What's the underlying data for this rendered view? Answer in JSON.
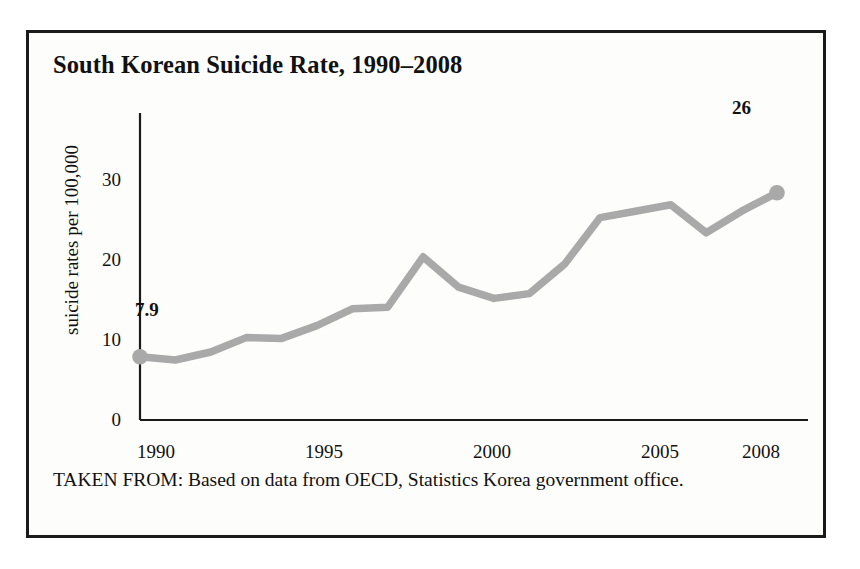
{
  "figure": {
    "title": "South Korean Suicide Rate, 1990–2008",
    "caption": "TAKEN FROM: Based on data from OECD, Statistics Korea government office.",
    "line_color": "#a9a9a9",
    "axis_color": "#1a1a1a",
    "border_color": "#1a1a1a",
    "text_color": "#111111"
  },
  "chart_data": {
    "type": "line",
    "title": "South Korean Suicide Rate, 1990–2008",
    "xlabel": "",
    "ylabel": "suicide rates per 100,000",
    "xlim": [
      1990,
      2008
    ],
    "ylim": [
      0,
      32
    ],
    "grid": false,
    "legend": false,
    "xticks": [
      "1990",
      "1995",
      "2000",
      "2005",
      "2008"
    ],
    "xtick_values": [
      1990,
      1995,
      2000,
      2005,
      2008
    ],
    "yticks": [
      "0",
      "10",
      "20",
      "30"
    ],
    "ytick_values": [
      0,
      10,
      20,
      30
    ],
    "x": [
      1990,
      1991,
      1992,
      1993,
      1994,
      1995,
      1996,
      1997,
      1998,
      1999,
      2000,
      2001,
      2002,
      2003,
      2004,
      2005,
      2006,
      2007,
      2008
    ],
    "values": [
      7.9,
      7.5,
      8.5,
      10.3,
      10.2,
      11.8,
      13.9,
      14.1,
      20.4,
      16.6,
      15.2,
      15.8,
      19.5,
      25.3,
      26.1,
      26.9,
      23.4,
      26.1,
      28.4
    ],
    "annotations": [
      {
        "label": "7.9",
        "x": 1990,
        "y": 7.9,
        "position": "below-left"
      },
      {
        "label": "26",
        "x": 2008,
        "y": 28.4,
        "position": "above"
      }
    ],
    "markers": [
      {
        "x": 1990,
        "y": 7.9
      },
      {
        "x": 2008,
        "y": 28.4
      }
    ]
  }
}
